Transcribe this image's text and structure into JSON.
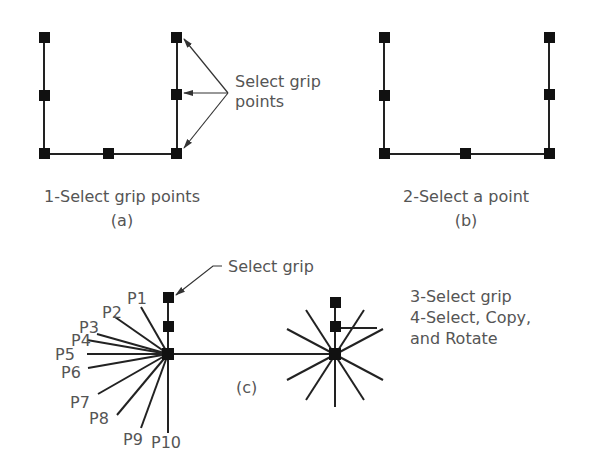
{
  "panels": {
    "a": {
      "caption": "1-Select grip points",
      "tag": "(a)",
      "callout_line1": "Select grip",
      "callout_line2": "points"
    },
    "b": {
      "caption": "2-Select a point",
      "tag": "(b)"
    },
    "c": {
      "tag": "(c)",
      "callout": "Select grip",
      "point_labels": [
        "P1",
        "P2",
        "P3",
        "P4",
        "P5",
        "P6",
        "P7",
        "P8",
        "P9",
        "P10"
      ],
      "steps": [
        "3-Select grip",
        "4-Select, Copy,",
        "and Rotate"
      ]
    }
  },
  "colors": {
    "line": "#222222",
    "grip": "#111111",
    "text": "#555555"
  }
}
